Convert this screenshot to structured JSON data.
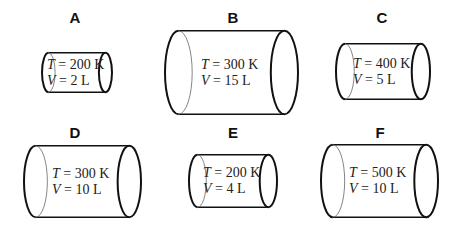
{
  "containers": [
    {
      "id": "A",
      "label": "A",
      "T": "200 K",
      "V": "2 L",
      "lx": 75,
      "ly": 9,
      "x": 42,
      "y": 52,
      "w": 70,
      "h": 41
    },
    {
      "id": "B",
      "label": "B",
      "T": "300 K",
      "V": "15 L",
      "lx": 233,
      "ly": 9,
      "x": 165,
      "y": 30,
      "w": 133,
      "h": 85
    },
    {
      "id": "C",
      "label": "C",
      "T": "400 K",
      "V": "5 L",
      "lx": 382,
      "ly": 9,
      "x": 336,
      "y": 43,
      "w": 94,
      "h": 57
    },
    {
      "id": "D",
      "label": "D",
      "T": "300 K",
      "V": "10 L",
      "lx": 75,
      "ly": 124,
      "x": 24,
      "y": 145,
      "w": 117,
      "h": 73
    },
    {
      "id": "E",
      "label": "E",
      "T": "200 K",
      "V": "4 L",
      "lx": 233,
      "ly": 124,
      "x": 189,
      "y": 154,
      "w": 88,
      "h": 54
    },
    {
      "id": "F",
      "label": "F",
      "T": "500 K",
      "V": "10 L",
      "lx": 380,
      "ly": 124,
      "x": 321,
      "y": 144,
      "w": 117,
      "h": 74
    }
  ],
  "symbols": {
    "T": "T",
    "V": "V",
    "eq": " = "
  }
}
